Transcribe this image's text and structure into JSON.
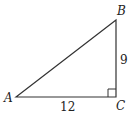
{
  "diagram": {
    "type": "right-triangle",
    "vertices": {
      "A": {
        "label": "A",
        "x": 16,
        "y": 97
      },
      "B": {
        "label": "B",
        "x": 116,
        "y": 20
      },
      "C": {
        "label": "C",
        "x": 116,
        "y": 97
      }
    },
    "sides": {
      "AC": {
        "label": "12"
      },
      "BC": {
        "label": "9"
      }
    },
    "right_angle_at": "C",
    "stroke_color": "#333333"
  }
}
